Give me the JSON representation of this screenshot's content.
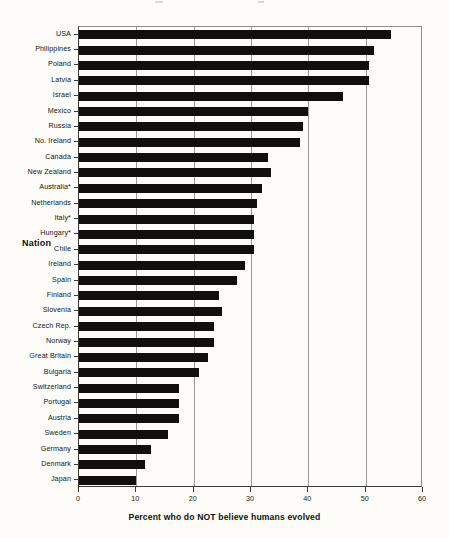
{
  "chart_data": {
    "type": "bar",
    "orientation": "horizontal",
    "title": "",
    "xlabel": "Percent who do NOT believe humans evolved",
    "ylabel": "Nation",
    "xlim": [
      0,
      60
    ],
    "xticks": [
      0,
      10,
      20,
      30,
      40,
      50,
      60
    ],
    "xtick_labels": [
      "0",
      "10",
      "20",
      "30",
      "40",
      "50",
      "60"
    ],
    "grid": "vertical",
    "legend": "none",
    "bar_color": "#100f0d",
    "categories": [
      "USA",
      "Philippines",
      "Poland",
      "Latvia",
      "Israel",
      "Mexico",
      "Russia",
      "No. Ireland",
      "Canada",
      "New Zealand",
      "Australia*",
      "Netherlands",
      "Italy*",
      "Hungary*",
      "Chile",
      "Ireland",
      "Spain",
      "Finland",
      "Slovenia",
      "Czech Rep.",
      "Norway",
      "Great Britain",
      "Bulgaria",
      "Switzerland",
      "Portugal",
      "Austria",
      "Sweden",
      "Germany",
      "Denmark",
      "Japan"
    ],
    "values": [
      54.5,
      51.5,
      50.5,
      50.5,
      46,
      40,
      39,
      38.5,
      33,
      33.5,
      32,
      31,
      30.5,
      30.5,
      30.5,
      29,
      27.5,
      24.5,
      25,
      23.5,
      23.5,
      22.5,
      21,
      17.5,
      17.5,
      17.5,
      15.5,
      12.5,
      11.5,
      10
    ]
  },
  "axis": {
    "x_title": "Percent who do NOT believe humans evolved",
    "y_title": "Nation"
  }
}
